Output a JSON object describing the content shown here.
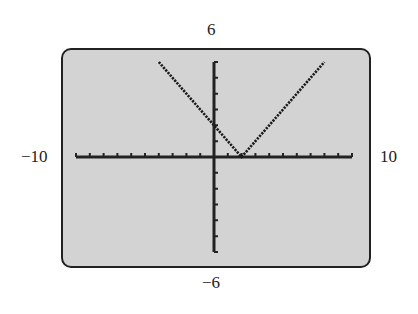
{
  "window": {
    "xmin": "−10",
    "xmax": "10",
    "ymin": "−6",
    "ymax": "6"
  },
  "colors": {
    "screen_background": "#d3d3d3",
    "axis": "#222222",
    "curve": "#1a1a1a",
    "page_background": "#ffffff"
  },
  "chart_data": {
    "type": "line",
    "title": "",
    "xlabel": "",
    "ylabel": "",
    "xlim": [
      -10,
      10
    ],
    "ylim": [
      -6,
      6
    ],
    "xscale_tick": 1,
    "yscale_tick": 1,
    "grid": false,
    "legend": null,
    "function": "y = |x − 2|",
    "series": [
      {
        "name": "y = |x - 2|",
        "style": "dotted pixel line",
        "x": [
          -4,
          -3,
          -2,
          -1,
          0,
          1,
          2,
          3,
          4,
          5,
          6,
          7,
          8
        ],
        "y": [
          6,
          5,
          4,
          3,
          2,
          1,
          0,
          1,
          2,
          3,
          4,
          5,
          6
        ]
      }
    ],
    "tick_labels": {
      "left": "−10",
      "right": "10",
      "top": "6",
      "bottom": "−6"
    }
  }
}
